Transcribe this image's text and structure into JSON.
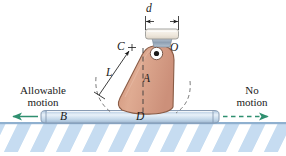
{
  "figure": {
    "type": "engineering-mechanics-diagram",
    "colors": {
      "body_fill": "#d9a086",
      "body_fill_light": "#e3b49e",
      "body_stroke": "#8a5c46",
      "block_fill": "#f4efe7",
      "block_stroke": "#9a9a96",
      "neck_fill": "#9aa8b8",
      "surface_fill": "#cfdced",
      "surface_stroke": "#7f93ab",
      "hatch_fill": "#bcd4ea",
      "arrow_green": "#2f8f6f",
      "line_black": "#1a1a1a",
      "pin_ring": "#ffffff",
      "pin_center": "#1a1a1a"
    },
    "labels": {
      "d": "d",
      "C": "C",
      "O": "O",
      "L": "L",
      "A": "A",
      "B": "B",
      "D": "D",
      "allowable_motion": "Allowable\nmotion",
      "allowable_motion_line1": "Allowable",
      "allowable_motion_line2": "motion",
      "no_motion_line1": "No",
      "no_motion_line2": "motion"
    },
    "annotations": {
      "d_dimension": "width of top block, horizontal dimension with inward arrowheads",
      "L_dimension": "slant length from C to lower-left arc, arrow at upper end, tick at lower end",
      "center_line": "dashed vertical center line from O through A to D",
      "left_arc": "dashed arc showing tipping path to the left",
      "right_arc": "dashed arc showing tipping path to the right",
      "left_arrow": "solid green arrow pointing left (allowable motion)",
      "right_arrow": "dashed green arrow pointing right (no motion)"
    }
  }
}
